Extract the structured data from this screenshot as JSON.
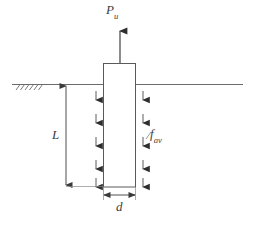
{
  "figure": {
    "type": "engineering-schematic",
    "width": 254,
    "height": 226,
    "background_color": "#ffffff",
    "line_color": "#4a4a4a",
    "label_color": "#3c3c3c"
  },
  "labels": {
    "uplift_load": {
      "symbol": "P",
      "subscript": "u"
    },
    "embedment_length": {
      "symbol": "L",
      "subscript": ""
    },
    "unit_skin_friction": {
      "symbol": "f",
      "subscript": "av"
    },
    "pile_diameter": {
      "symbol": "d",
      "subscript": ""
    }
  },
  "elements": {
    "ground_line": {
      "name": "ground-surface-line",
      "y": 84,
      "x_start": 12,
      "x_end": 243
    },
    "ground_hatch": {
      "name": "ground-hatching",
      "x_start": 16,
      "x_end": 40,
      "count": 6
    },
    "pile": {
      "name": "pile-shaft",
      "left": 103,
      "right": 136,
      "top": 63,
      "bottom": 187,
      "fill": "#ffffff"
    },
    "uplift_arrow": {
      "name": "uplift-load-arrow",
      "x": 120,
      "y_tail": 63,
      "y_head": 27,
      "direction": "up"
    },
    "friction_arrows_left": {
      "name": "skin-friction-arrows-left",
      "x": 96,
      "count": 5,
      "direction": "down"
    },
    "friction_arrows_right": {
      "name": "skin-friction-arrows-right",
      "x": 143,
      "count": 5,
      "direction": "down"
    },
    "length_dimension": {
      "name": "embedment-length-dimension",
      "x": 66,
      "y_top": 85,
      "y_bottom": 186
    },
    "diameter_dimension": {
      "name": "pile-diameter-dimension",
      "y": 195,
      "x_left": 103,
      "x_right": 136
    }
  }
}
